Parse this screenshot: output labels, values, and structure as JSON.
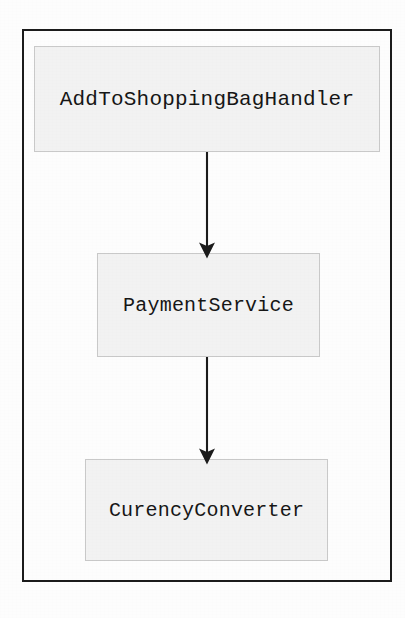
{
  "diagram": {
    "background_color": "#fdfdfd",
    "frame": {
      "name": "outer-frame",
      "border_color": "#1b1b1b",
      "x": 22,
      "y": 29,
      "width": 370,
      "height": 553
    },
    "node_style": {
      "fill_color": "#f2f2f2",
      "border_color": "#c9c9c9",
      "text_color": "#161616"
    },
    "edge_style": {
      "line_color": "#1b1b1b",
      "arrowhead": "filled-triangle"
    },
    "nodes": [
      {
        "id": "handler",
        "label": "AddToShoppingBagHandler",
        "x": 34,
        "y": 46,
        "width": 346,
        "height": 106
      },
      {
        "id": "payment",
        "label": "PaymentService",
        "x": 97,
        "y": 253,
        "width": 223,
        "height": 104
      },
      {
        "id": "converter",
        "label": "CurencyConverter",
        "x": 85,
        "y": 459,
        "width": 243,
        "height": 102
      }
    ],
    "edges": [
      {
        "id": "handler-to-payment",
        "from": "handler",
        "to": "payment",
        "label": "",
        "x": 207,
        "y1": 152,
        "y2": 253
      },
      {
        "id": "payment-to-converter",
        "from": "payment",
        "to": "converter",
        "label": "",
        "x": 207,
        "y1": 357,
        "y2": 459
      }
    ]
  }
}
